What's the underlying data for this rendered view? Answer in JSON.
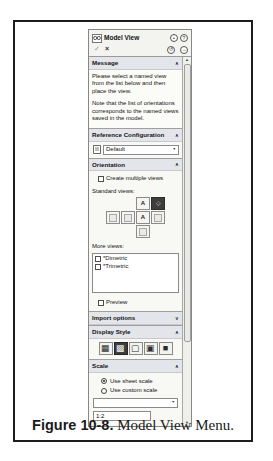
{
  "figure_caption": {
    "bold": "Figure 10-8.",
    "text": " Model View Menu."
  },
  "glyphs": {
    "chevron_up": "∧",
    "chevron_down": "∨",
    "ok": "✓",
    "cancel": "×",
    "pin": "•",
    "help": "?",
    "undo": "↺",
    "forward": "→",
    "scroll_up": "▲",
    "scroll_down": "▼",
    "combo_arrow": "▼",
    "iso_cube": "◇",
    "ds_wireframe": "▦",
    "ds_hidden_lines_visible": "▩",
    "ds_hidden_lines_removed": "▢",
    "ds_shaded_with_edges": "▣",
    "ds_shaded": "■"
  },
  "panel": {
    "title": "Model View",
    "message": {
      "header": "Message",
      "paragraphs": [
        "Please select a named view from the list below and then place the view.",
        "Note that the list of orientations corresponds to the named views saved in the model."
      ]
    },
    "reference_configuration": {
      "header": "Reference Configuration",
      "selected_value": "Default"
    },
    "orientation": {
      "header": "Orientation",
      "create_multiple_views_label": "Create multiple views",
      "standard_views_label": "Standard views:",
      "views": {
        "top": {
          "letter": "A",
          "selected": false
        },
        "isometric": {
          "selected": true
        },
        "front": {
          "letter": "A",
          "selected": false
        }
      },
      "more_views_label": "More views:",
      "more_views": [
        {
          "label": "*Dimetric",
          "checked": false
        },
        {
          "label": "*Trimetric",
          "checked": false
        }
      ],
      "preview_label": "Preview"
    },
    "import_options": {
      "header": "Import options",
      "collapsed": true
    },
    "display_style": {
      "header": "Display Style",
      "buttons": [
        "wireframe",
        "hidden-lines-visible",
        "hidden-lines-removed",
        "shaded-with-edges",
        "shaded"
      ],
      "selected": "hidden-lines-visible"
    },
    "scale": {
      "header": "Scale",
      "options": [
        {
          "label": "Use sheet scale",
          "selected": true
        },
        {
          "label": "Use custom scale",
          "selected": false
        }
      ],
      "custom_scale_value": "",
      "scale_ratio": "1:2"
    }
  },
  "colors": {
    "selected_button_bg": "#3d3d3d",
    "panel_bg": "#f8f8f5",
    "section_header_bg": "#e3e5ea",
    "frame_border": "#1c1c1c"
  }
}
